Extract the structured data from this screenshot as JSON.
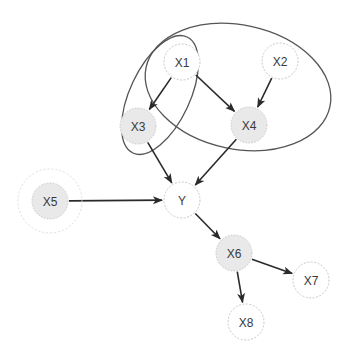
{
  "diagram": {
    "type": "directed-graph",
    "colors": {
      "background": "#ffffff",
      "node_stroke": "#c8c8c8",
      "node_fill_plain": "#ffffff",
      "node_fill_shaded": "#e9e9e9",
      "edge": "#2a2a2a",
      "ellipse_stroke": "#555555",
      "label": "#3a3a3a"
    },
    "nodes": [
      {
        "id": "X1",
        "label": "X1",
        "cx": 182,
        "cy": 62,
        "r": 18,
        "shaded": false
      },
      {
        "id": "X2",
        "label": "X2",
        "cx": 280,
        "cy": 61,
        "r": 18,
        "shaded": false
      },
      {
        "id": "X3",
        "label": "X3",
        "cx": 138,
        "cy": 126,
        "r": 18,
        "shaded": true
      },
      {
        "id": "X4",
        "label": "X4",
        "cx": 249,
        "cy": 125,
        "r": 18,
        "shaded": true
      },
      {
        "id": "X5",
        "label": "X5",
        "cx": 50,
        "cy": 201,
        "r": 18,
        "shaded": true,
        "halo_r": 32
      },
      {
        "id": "Y",
        "label": "Y",
        "cx": 182,
        "cy": 200,
        "r": 18,
        "shaded": false
      },
      {
        "id": "X6",
        "label": "X6",
        "cx": 234,
        "cy": 253,
        "r": 18,
        "shaded": true
      },
      {
        "id": "X7",
        "label": "X7",
        "cx": 311,
        "cy": 280,
        "r": 18,
        "shaded": false
      },
      {
        "id": "X8",
        "label": "X8",
        "cx": 246,
        "cy": 322,
        "r": 18,
        "shaded": false
      }
    ],
    "edges": [
      {
        "from": "X1",
        "to": "X3"
      },
      {
        "from": "X1",
        "to": "X4"
      },
      {
        "from": "X2",
        "to": "X4"
      },
      {
        "from": "X3",
        "to": "Y"
      },
      {
        "from": "X4",
        "to": "Y"
      },
      {
        "from": "X5",
        "to": "Y"
      },
      {
        "from": "Y",
        "to": "X6"
      },
      {
        "from": "X6",
        "to": "X7"
      },
      {
        "from": "X6",
        "to": "X8"
      }
    ],
    "groups": [
      {
        "id": "group-x1-x3",
        "members": [
          "X1",
          "X3"
        ],
        "cx": 160,
        "cy": 95,
        "rx": 30,
        "ry": 64,
        "rotate": 25
      },
      {
        "id": "group-x1-x2-x4",
        "members": [
          "X1",
          "X2",
          "X4"
        ],
        "cx": 238,
        "cy": 87,
        "rx": 94,
        "ry": 62,
        "rotate": 12
      }
    ]
  }
}
